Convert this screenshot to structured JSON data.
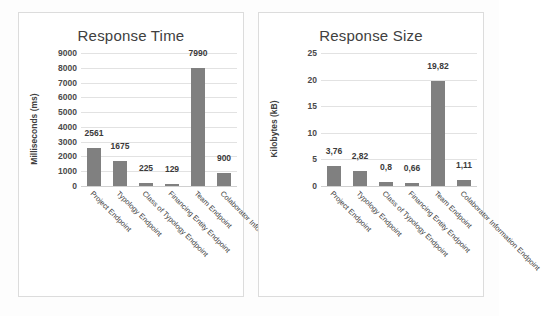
{
  "page": {
    "background": "#fdfdfd",
    "bar_color": "#808080",
    "grid_color": "#e2e2e2"
  },
  "charts": [
    {
      "id": "response-time",
      "title": "Response Time",
      "ylabel": "Milliseconds (ms)"
    },
    {
      "id": "response-size",
      "title": "Response Size",
      "ylabel": "Kilobytes (kB)"
    }
  ],
  "chart_data": [
    {
      "type": "bar",
      "title": "Response Time",
      "xlabel": "",
      "ylabel": "Milliseconds (ms)",
      "ylim": [
        0,
        9000
      ],
      "yticks": [
        0,
        1000,
        2000,
        3000,
        4000,
        5000,
        6000,
        7000,
        8000,
        9000
      ],
      "ytick_labels": [
        "0",
        "1000",
        "2000",
        "3000",
        "4000",
        "5000",
        "6000",
        "7000",
        "8000",
        "9000"
      ],
      "grid": true,
      "legend": false,
      "categories": [
        "Project Endpoint",
        "Typology Endpoint",
        "Class of Typology Endpoint",
        "Financing Entity Endpoint",
        "Team Endpoint",
        "Colaborator Information Endpoint"
      ],
      "values": [
        2561,
        1675,
        225,
        129,
        7990,
        900
      ],
      "data_labels": [
        "2561",
        "1675",
        "225",
        "129",
        "7990",
        "900"
      ],
      "series": [
        {
          "name": "Response Time",
          "values": [
            2561,
            1675,
            225,
            129,
            7990,
            900
          ]
        }
      ]
    },
    {
      "type": "bar",
      "title": "Response Size",
      "xlabel": "",
      "ylabel": "Kilobytes (kB)",
      "ylim": [
        0,
        25
      ],
      "yticks": [
        0,
        5,
        10,
        15,
        20,
        25
      ],
      "ytick_labels": [
        "0",
        "5",
        "10",
        "15",
        "20",
        "25"
      ],
      "grid": true,
      "legend": false,
      "categories": [
        "Project Endpoint",
        "Typology Endpoint",
        "Class of Typology Endpoint",
        "Financing Entity Endpoint",
        "Team Endpoint",
        "Colaborator Information Endpoint"
      ],
      "values": [
        3.76,
        2.82,
        0.8,
        0.66,
        19.82,
        1.11
      ],
      "data_labels": [
        "3,76",
        "2,82",
        "0,8",
        "0,66",
        "19,82",
        "1,11"
      ],
      "series": [
        {
          "name": "Response Size",
          "values": [
            3.76,
            2.82,
            0.8,
            0.66,
            19.82,
            1.11
          ]
        }
      ]
    }
  ]
}
